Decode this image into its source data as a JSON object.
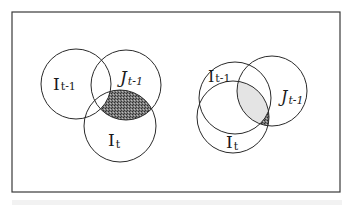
{
  "figure": {
    "frame_color": "#3a3a3a",
    "stroke_color": "#2a2a2a",
    "shade_color": "#6b6b6b",
    "left_diagram": {
      "circles": [
        {
          "id": "I_prev",
          "base": "I",
          "sub": "t-1",
          "cx": 76,
          "cy": 84,
          "r": 35,
          "label_x": 60,
          "label_y": 86
        },
        {
          "id": "J_prev",
          "base": "J",
          "sub": "t-1",
          "cx": 126,
          "cy": 85,
          "r": 35,
          "label_x": 120,
          "label_y": 78
        },
        {
          "id": "I_curr",
          "base": "I",
          "sub": "t",
          "cx": 120,
          "cy": 126,
          "r": 36,
          "label_x": 108,
          "label_y": 144
        }
      ],
      "shaded_region": "intersection of J_{t-1} and I_t, excluding I_{t-1}"
    },
    "right_diagram": {
      "circles": [
        {
          "id": "I_prev",
          "base": "I",
          "sub": "t-1",
          "cx": 235,
          "cy": 98,
          "r": 36,
          "label_x": 208,
          "label_y": 79
        },
        {
          "id": "J_prev",
          "base": "J",
          "sub": "t-1",
          "cx": 272,
          "cy": 91,
          "r": 35,
          "label_x": 281,
          "label_y": 100
        },
        {
          "id": "I_curr",
          "base": "I",
          "sub": "t",
          "cx": 233,
          "cy": 117,
          "r": 36,
          "label_x": 227,
          "label_y": 145
        }
      ],
      "shaded_region": "intersection of J_{t-1} and I_t, excluding I_{t-1}"
    }
  },
  "labels": {
    "left": {
      "i_prev_base": "I",
      "i_prev_sub": "t-1",
      "j_prev_base": "J",
      "j_prev_sub": "t-1",
      "i_curr_base": "I",
      "i_curr_sub": "t"
    },
    "right": {
      "i_prev_base": "I",
      "i_prev_sub": "t-1",
      "j_prev_base": "J",
      "j_prev_sub": "t-1",
      "i_curr_base": "I",
      "i_curr_sub": "t"
    }
  }
}
